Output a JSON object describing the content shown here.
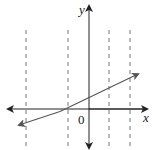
{
  "diagram": {
    "type": "coordinate-plane-line",
    "axes": {
      "x_label": "x",
      "y_label": "y",
      "origin_label": "0"
    },
    "dashed_vertical_lines": 4,
    "line": {
      "description": "straight line with positive slope, arrows at both ends",
      "crosses_y_axis": "above origin",
      "crosses_x_axis": "left of origin"
    },
    "colors": {
      "axes": "#222222",
      "line": "#555555",
      "dashed": "#666666"
    }
  }
}
